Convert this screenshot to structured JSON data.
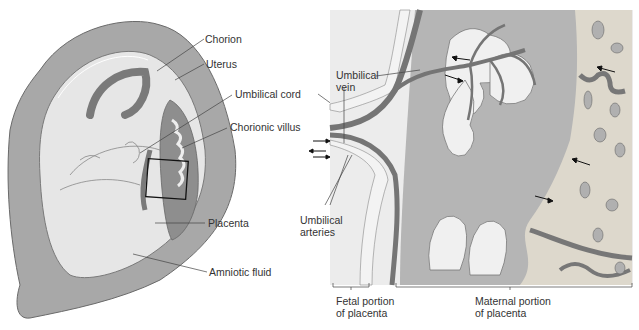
{
  "diagram": {
    "type": "anatomical-illustration",
    "colors": {
      "uterus": "#a8a8a8",
      "uterus_outline": "#6a6a6a",
      "amniotic": "#e6e6e6",
      "cord": "#7a7a7a",
      "maternal_blood": "#b5b5b5",
      "maternal_tissue": "#ddd8cc",
      "villus": "#f0f0f0",
      "vessel": "#757575"
    },
    "left_labels": {
      "chorion": "Chorion",
      "uterus": "Uterus",
      "umbilical_cord": "Umbilical cord",
      "chorionic_villus": "Chorionic villus",
      "placenta": "Placenta",
      "amniotic_fluid": "Amniotic fluid"
    },
    "right_labels": {
      "umbilical_vein_1": "Umbilical",
      "umbilical_vein_2": "vein",
      "umbilical_arteries_1": "Umbilical",
      "umbilical_arteries_2": "arteries",
      "fetal_portion_1": "Fetal portion",
      "fetal_portion_2": "of placenta",
      "maternal_portion_1": "Maternal portion",
      "maternal_portion_2": "of placenta"
    }
  }
}
